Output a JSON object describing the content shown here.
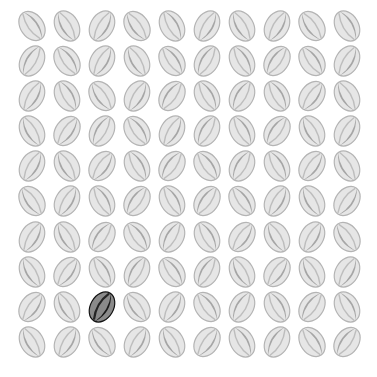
{
  "game": {
    "title": "Find the odd rugby ball",
    "rows": 10,
    "cols": 10,
    "odd_one": {
      "row": 8,
      "col": 2
    },
    "colors": {
      "background": "#ffffff",
      "ball_fill": "#e6e6e6",
      "ball_stripe": "#9a9a9a",
      "ball_outline": "#b4b4b4",
      "odd_fill": "#8a8a8a",
      "odd_stripe": "#1a1a1a",
      "odd_outline": "#111111"
    },
    "tilts": [
      [
        -35,
        -30,
        30,
        -35,
        -30,
        30,
        -30,
        30,
        -35,
        -30
      ],
      [
        30,
        -35,
        30,
        -30,
        -35,
        30,
        -30,
        35,
        -35,
        30
      ],
      [
        30,
        -30,
        -35,
        30,
        35,
        -30,
        30,
        -30,
        35,
        -30
      ],
      [
        -30,
        35,
        30,
        -35,
        30,
        30,
        -30,
        35,
        -30,
        30
      ],
      [
        30,
        -30,
        35,
        -30,
        35,
        -35,
        30,
        -30,
        35,
        -30
      ],
      [
        -35,
        30,
        -30,
        35,
        -30,
        35,
        -35,
        30,
        -30,
        35
      ],
      [
        30,
        -30,
        35,
        -35,
        30,
        -30,
        35,
        -30,
        30,
        -35
      ],
      [
        -30,
        35,
        -30,
        30,
        -35,
        30,
        -30,
        35,
        -30,
        30
      ],
      [
        35,
        -30,
        30,
        -35,
        30,
        -35,
        30,
        -30,
        35,
        -30
      ],
      [
        -30,
        30,
        -35,
        30,
        -30,
        35,
        -30,
        30,
        -35,
        35
      ]
    ],
    "stripe_side": [
      [
        1,
        0,
        1,
        0,
        1,
        1,
        0,
        1,
        0,
        1
      ],
      [
        0,
        1,
        1,
        0,
        1,
        0,
        1,
        0,
        1,
        1
      ],
      [
        1,
        1,
        0,
        1,
        0,
        1,
        0,
        1,
        1,
        0
      ],
      [
        0,
        1,
        0,
        1,
        1,
        0,
        1,
        0,
        0,
        1
      ],
      [
        1,
        0,
        1,
        1,
        0,
        1,
        0,
        1,
        1,
        0
      ],
      [
        0,
        1,
        1,
        0,
        1,
        0,
        1,
        1,
        0,
        1
      ],
      [
        1,
        0,
        0,
        1,
        0,
        1,
        1,
        0,
        1,
        0
      ],
      [
        0,
        1,
        1,
        0,
        1,
        0,
        0,
        1,
        0,
        1
      ],
      [
        1,
        0,
        1,
        0,
        1,
        1,
        0,
        1,
        0,
        1
      ],
      [
        0,
        1,
        0,
        1,
        0,
        1,
        1,
        0,
        1,
        0
      ]
    ],
    "accessible_label": "Rugby ball"
  }
}
